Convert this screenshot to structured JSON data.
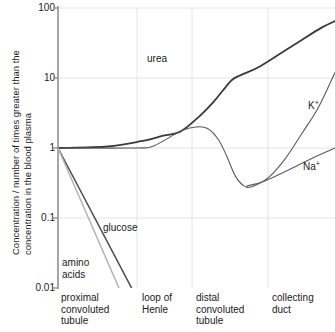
{
  "chart_data": {
    "type": "line",
    "title": "",
    "xlabel": "",
    "ylabel": "Concentration / number of times greater than the concentration in the blood plasma",
    "ylabel_line1": "Concentration / number of times greater than the",
    "ylabel_line2": "concentration in the blood plasma",
    "yscale": "log",
    "ylim": [
      0.01,
      100
    ],
    "yticks": [
      "100",
      "10",
      "1",
      "0.1",
      "0.01"
    ],
    "ytick_values": [
      100,
      10,
      1,
      0.1,
      0.01
    ],
    "grid": true,
    "legend": "inline-annotations",
    "categories": [
      "proximal convoluted tubule",
      "loop of Henle",
      "distal convoluted tubule",
      "collecting duct"
    ],
    "xtick_labels": [
      {
        "line1": "proximal",
        "line2": "convoluted",
        "line3": "tubule"
      },
      {
        "line1": "loop of",
        "line2": "Henle",
        "line3": ""
      },
      {
        "line1": "distal",
        "line2": "convoluted",
        "line3": "tubule"
      },
      {
        "line1": "collecting",
        "line2": "duct",
        "line3": ""
      }
    ],
    "series": [
      {
        "name": "urea",
        "label": "urea",
        "color": "#3a3a3a",
        "width": 1.8,
        "points": [
          {
            "x": 0.0,
            "y": 1.0
          },
          {
            "x": 0.18,
            "y": 1.05
          },
          {
            "x": 0.3,
            "y": 1.25
          },
          {
            "x": 0.38,
            "y": 1.5
          },
          {
            "x": 0.44,
            "y": 1.7
          },
          {
            "x": 0.5,
            "y": 2.6
          },
          {
            "x": 0.56,
            "y": 4.5
          },
          {
            "x": 0.6,
            "y": 7.0
          },
          {
            "x": 0.63,
            "y": 9.5
          },
          {
            "x": 0.66,
            "y": 11.0
          },
          {
            "x": 0.72,
            "y": 14.0
          },
          {
            "x": 0.8,
            "y": 22.0
          },
          {
            "x": 0.88,
            "y": 35.0
          },
          {
            "x": 0.95,
            "y": 52.0
          },
          {
            "x": 1.0,
            "y": 65.0
          }
        ]
      },
      {
        "name": "potassium",
        "label": "K",
        "label_sup": "+",
        "color": "#5a5a5a",
        "width": 1.1,
        "points": [
          {
            "x": 0.0,
            "y": 1.0
          },
          {
            "x": 0.28,
            "y": 1.0
          },
          {
            "x": 0.34,
            "y": 1.05
          },
          {
            "x": 0.4,
            "y": 1.4
          },
          {
            "x": 0.45,
            "y": 1.8
          },
          {
            "x": 0.5,
            "y": 2.0
          },
          {
            "x": 0.54,
            "y": 1.9
          },
          {
            "x": 0.58,
            "y": 1.3
          },
          {
            "x": 0.61,
            "y": 0.75
          },
          {
            "x": 0.64,
            "y": 0.4
          },
          {
            "x": 0.67,
            "y": 0.29
          },
          {
            "x": 0.7,
            "y": 0.28
          },
          {
            "x": 0.76,
            "y": 0.38
          },
          {
            "x": 0.82,
            "y": 0.7
          },
          {
            "x": 0.88,
            "y": 1.6
          },
          {
            "x": 0.94,
            "y": 3.8
          },
          {
            "x": 1.0,
            "y": 12.0
          }
        ]
      },
      {
        "name": "sodium",
        "label": "Na",
        "label_sup": "+",
        "color": "#5a5a5a",
        "width": 1.1,
        "points": [
          {
            "x": 0.68,
            "y": 0.285
          },
          {
            "x": 0.74,
            "y": 0.33
          },
          {
            "x": 0.8,
            "y": 0.42
          },
          {
            "x": 0.86,
            "y": 0.55
          },
          {
            "x": 0.92,
            "y": 0.72
          },
          {
            "x": 1.0,
            "y": 1.0
          }
        ]
      },
      {
        "name": "glucose",
        "label": "glucose",
        "color": "#4a4a4a",
        "width": 1.5,
        "points": [
          {
            "x": 0.0,
            "y": 1.0
          },
          {
            "x": 0.28,
            "y": 0.0078
          }
        ]
      },
      {
        "name": "amino acids",
        "label": "amino acids",
        "label_line1": "amino",
        "label_line2": "acids",
        "color": "#b5b5b5",
        "width": 1.5,
        "points": [
          {
            "x": 0.0,
            "y": 1.0
          },
          {
            "x": 0.225,
            "y": 0.009
          }
        ]
      }
    ],
    "annotations": [
      {
        "name": "urea-label",
        "text": "urea",
        "x_px": 147,
        "y_px": 62
      },
      {
        "name": "potassium-label",
        "text": "K",
        "sup": "+",
        "x_px": 310,
        "y_px": 106
      },
      {
        "name": "sodium-label",
        "text": "Na",
        "sup": "+",
        "x_px": 306,
        "y_px": 167
      },
      {
        "name": "glucose-label",
        "text": "glucose",
        "x_px": 104,
        "y_px": 228
      },
      {
        "name": "amino-acids-label",
        "text": "amino acids",
        "x_px": 62,
        "y_px": 263
      }
    ],
    "colors": {
      "axis": "#808080",
      "grid": "#e2e2e2",
      "urea": "#3a3a3a",
      "ions": "#5a5a5a",
      "glucose": "#4a4a4a",
      "amino_acids": "#b5b5b5",
      "text": "#1a1a1a",
      "background": "#ffffff"
    }
  }
}
